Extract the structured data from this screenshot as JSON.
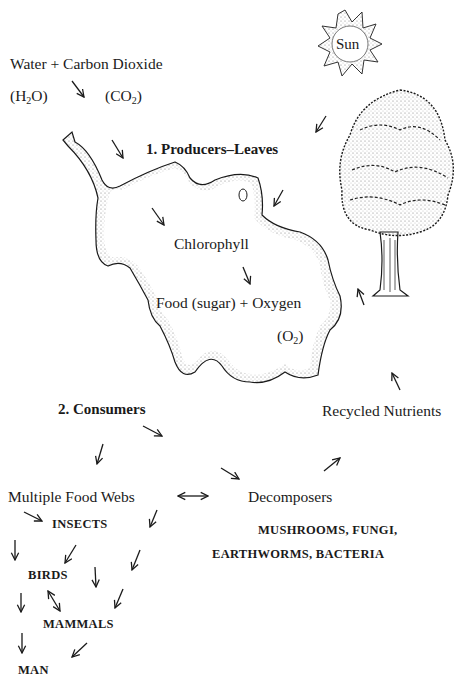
{
  "diagram": {
    "inputs": {
      "line1": "Water + Carbon Dioxide",
      "water_formula_pre": "(H",
      "water_formula_sub": "2",
      "water_formula_post": "O)",
      "co2_formula_pre": "(CO",
      "co2_formula_sub": "2",
      "co2_formula_post": ")"
    },
    "sun": {
      "label": "Sun"
    },
    "producers": {
      "heading": "1. Producers–Leaves"
    },
    "leaf": {
      "chlorophyll": "Chlorophyll",
      "output": "Food (sugar) + Oxygen",
      "o2_pre": "(O",
      "o2_sub": "2",
      "o2_post": ")"
    },
    "consumers": {
      "heading": "2. Consumers"
    },
    "recycled": {
      "label": "Recycled Nutrients"
    },
    "food_webs": {
      "label": "Multiple Food Webs"
    },
    "decomposers": {
      "label": "Decomposers",
      "examples_line1": "MUSHROOMS, FUNGI,",
      "examples_line2": "EARTHWORMS, BACTERIA"
    },
    "food_chain": {
      "insects": "INSECTS",
      "birds": "BIRDS",
      "mammals": "MAMMALS",
      "man": "MAN"
    },
    "colors": {
      "ink": "#1a1a1a",
      "background": "#ffffff",
      "stipple": "#555555"
    }
  }
}
